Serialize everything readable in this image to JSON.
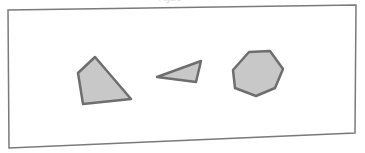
{
  "figure": {
    "caption_cropped": "Figure",
    "frame": {
      "points": "8,10 356,5 355,133 9,148",
      "stroke": "#7a7a7a"
    },
    "shapes": [
      {
        "name": "quadrilateral",
        "points": "95,57 78,73 83,104 131,99",
        "fill": "#c8c8c8",
        "stroke": "#6e6e6e"
      },
      {
        "name": "triangle",
        "points": "157,77 201,61 196,82",
        "fill": "#c8c8c8",
        "stroke": "#6e6e6e"
      },
      {
        "name": "heptagon",
        "points": "249,52 270,51 283,69 275,88 256,96 235,88 233,70",
        "fill": "#c8c8c8",
        "stroke": "#6e6e6e"
      }
    ]
  }
}
